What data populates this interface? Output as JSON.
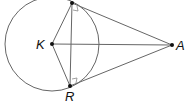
{
  "diagram": {
    "type": "circle-with-tangents",
    "colors": {
      "line": "#666666",
      "point": "#111111",
      "label": "#111111"
    },
    "circle": {
      "center": "K",
      "cx": 52,
      "cy": 44,
      "r": 47
    },
    "points": [
      {
        "id": "T",
        "label": "",
        "x": 72,
        "y": 3
      },
      {
        "id": "K",
        "label": "K",
        "x": 52,
        "y": 44
      },
      {
        "id": "R",
        "label": "R",
        "x": 70,
        "y": 86
      },
      {
        "id": "A",
        "label": "A",
        "x": 172,
        "y": 45
      }
    ],
    "segments": [
      [
        "T",
        "A"
      ],
      [
        "R",
        "A"
      ],
      [
        "K",
        "A"
      ],
      [
        "K",
        "T"
      ],
      [
        "K",
        "R"
      ],
      [
        "T",
        "R"
      ]
    ],
    "right_angle_marks": [
      "T",
      "R"
    ]
  },
  "labels": {
    "K": "K",
    "R": "R",
    "A": "A"
  }
}
